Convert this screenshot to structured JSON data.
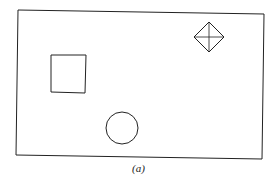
{
  "figure": {
    "caption": "(a)",
    "shapes": [
      {
        "type": "rectangle-frame",
        "label": "frame"
      },
      {
        "type": "diamond-with-cross",
        "label": "diamond"
      },
      {
        "type": "square",
        "label": "square"
      },
      {
        "type": "circle",
        "label": "circle"
      }
    ],
    "colors": {
      "stroke": "#222222",
      "background": "#ffffff"
    }
  }
}
